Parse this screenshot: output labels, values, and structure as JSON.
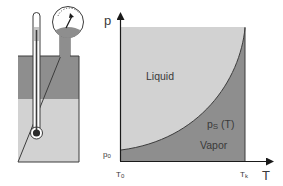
{
  "colors": {
    "liquid": "#d2d2d2",
    "vapor": "#8e8e8e",
    "outline": "#3c3c3c",
    "background": "#ffffff"
  },
  "apparatus": {
    "components": [
      "container",
      "thermometer",
      "pressure-gauge"
    ],
    "phases": [
      "vapor",
      "liquid"
    ]
  },
  "diagram": {
    "y_axis_label": "p",
    "x_axis_label": "T",
    "region_upper_label": "Liquid",
    "region_lower_label": "Vapor",
    "curve_label_main": "p",
    "curve_label_sub": "S",
    "curve_label_arg": " (T)",
    "y_tick_main": "p",
    "y_tick_sub": "0",
    "x_tick_start_main": "T",
    "x_tick_start_sub": "0",
    "x_tick_end_main": "T",
    "x_tick_end_sub": "k"
  }
}
